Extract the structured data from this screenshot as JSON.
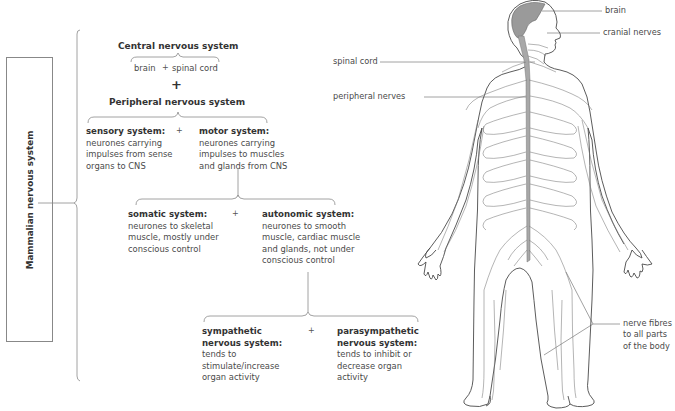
{
  "side_label": "Mammalian nervous system",
  "central": {
    "title": "Central nervous system",
    "parts": [
      "brain",
      "spinal cord"
    ],
    "plus": "+"
  },
  "join_plus": "+",
  "peripheral": {
    "title": "Peripheral nervous system",
    "sensory": {
      "heading": "sensory system:",
      "lines": [
        "neurones carrying",
        "impulses from sense",
        "organs to CNS"
      ]
    },
    "plus": "+",
    "motor": {
      "heading": "motor system:",
      "lines": [
        "neurones carrying",
        "impulses to muscles",
        "and glands from CNS"
      ]
    }
  },
  "motor_branches": {
    "somatic": {
      "heading": "somatic system:",
      "lines": [
        "neurones to skeletal",
        "muscle, mostly under",
        "conscious control"
      ]
    },
    "plus": "+",
    "autonomic": {
      "heading": "autonomic system:",
      "lines": [
        "neurones to smooth",
        "muscle, cardiac muscle",
        "and glands, not under",
        "conscious control"
      ]
    }
  },
  "autonomic_branches": {
    "sympathetic": {
      "heading_lines": [
        "sympathetic",
        "nervous system:"
      ],
      "lines": [
        "tends to",
        "stimulate/increase",
        "organ activity"
      ]
    },
    "plus": "+",
    "parasympathetic": {
      "heading_lines": [
        "parasympathetic",
        "nervous system:"
      ],
      "lines": [
        "tends to inhibit or",
        "decrease organ",
        "activity"
      ]
    }
  },
  "body_labels": {
    "brain": "brain",
    "cranial_nerves": "cranial nerves",
    "spinal_cord": "spinal cord",
    "peripheral_nerves": "peripheral nerves",
    "nerve_fibres": [
      "nerve fibres",
      "to all parts",
      "of the body"
    ]
  },
  "colors": {
    "line": "#888888",
    "brain_fill": "#9a9a9a",
    "spinal_fill": "#a8a8a8",
    "text": "#4a4a4a"
  }
}
